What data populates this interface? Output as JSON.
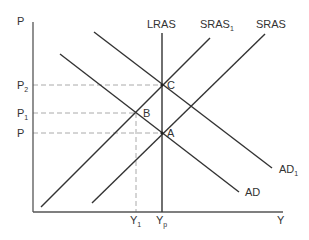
{
  "diagram": {
    "axes": {
      "y_label": "P",
      "x_label": "Y"
    },
    "price_levels": [
      {
        "id": "P2",
        "label": "P",
        "sub": "2"
      },
      {
        "id": "P1",
        "label": "P",
        "sub": "1"
      },
      {
        "id": "P",
        "label": "P",
        "sub": ""
      }
    ],
    "output_levels": [
      {
        "id": "Y1",
        "label": "Y",
        "sub": "1"
      },
      {
        "id": "Yp",
        "label": "Y",
        "sub": "p"
      }
    ],
    "curves": [
      {
        "id": "LRAS",
        "label": "LRAS",
        "sub": ""
      },
      {
        "id": "SRAS1",
        "label": "SRAS",
        "sub": "1"
      },
      {
        "id": "SRAS",
        "label": "SRAS",
        "sub": ""
      },
      {
        "id": "AD1",
        "label": "AD",
        "sub": "1"
      },
      {
        "id": "AD",
        "label": "AD",
        "sub": ""
      }
    ],
    "points": [
      {
        "id": "A",
        "label": "A"
      },
      {
        "id": "B",
        "label": "B"
      },
      {
        "id": "C",
        "label": "C"
      }
    ],
    "colors": {
      "line": "#333333",
      "guide": "#aaaaaa",
      "text": "#333333"
    }
  }
}
